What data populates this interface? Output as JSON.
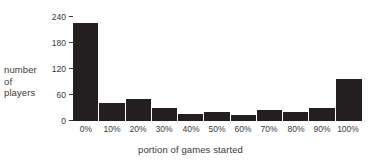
{
  "chart_data": {
    "type": "bar",
    "title": "",
    "subtitle": "",
    "xlabel": "portion of games started",
    "ylabel": "number of players",
    "ylabel_lines": [
      "number",
      "of",
      "players"
    ],
    "categories": [
      "0%",
      "10%",
      "20%",
      "30%",
      "40%",
      "50%",
      "60%",
      "70%",
      "80%",
      "90%",
      "100%"
    ],
    "values": [
      227,
      42,
      51,
      30,
      16,
      21,
      15,
      25,
      21,
      30,
      96
    ],
    "series": [
      {
        "name": "number of players",
        "values": [
          227,
          42,
          51,
          30,
          16,
          21,
          15,
          25,
          21,
          30,
          96
        ]
      }
    ],
    "ylim": [
      0,
      240
    ],
    "yticks": [
      0,
      60,
      120,
      180,
      240
    ],
    "ytick_labels": [
      "0",
      "60",
      "120",
      "180",
      "240"
    ],
    "xlim": [
      0,
      11
    ],
    "grid": false,
    "legend": false,
    "legend_position": "none",
    "bar_color": "#231f20",
    "text_color": "#3a3a3a",
    "background_color": "#ffffff",
    "annotations": []
  }
}
